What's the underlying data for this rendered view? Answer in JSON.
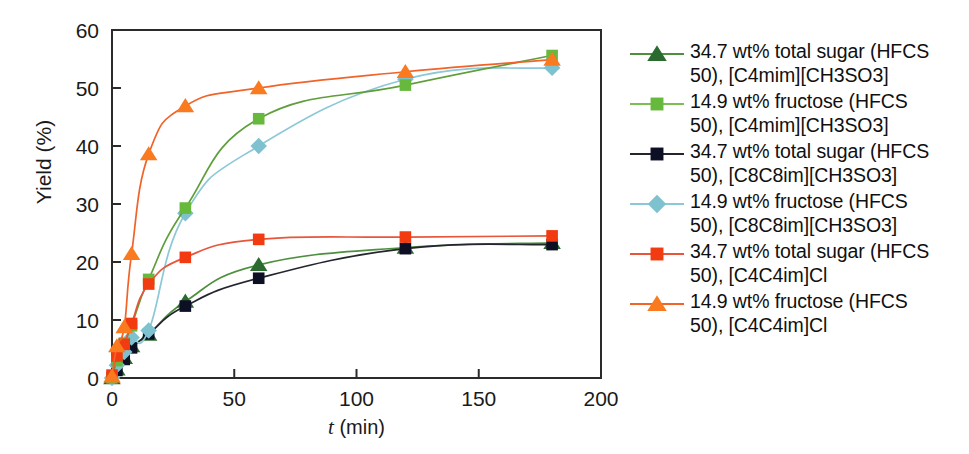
{
  "chart_data": {
    "type": "line",
    "title": "",
    "xlabel": "t (min)",
    "xlabel_italic": "t",
    "xlabel_rest": " (min)",
    "ylabel": "Yield (%)",
    "xlim": [
      0,
      200
    ],
    "ylim": [
      0,
      60
    ],
    "xticks": [
      0,
      50,
      100,
      150,
      200
    ],
    "yticks": [
      0,
      10,
      20,
      30,
      40,
      50,
      60
    ],
    "grid": false,
    "legend_position": "right",
    "x": [
      0,
      2,
      5,
      8,
      15,
      30,
      60,
      120,
      180
    ],
    "series": [
      {
        "name": "34.7 wt% total sugar (HFCS 50), [C4mim][CH3SO3]",
        "label_line1": "34.7 wt% total sugar (HFCS",
        "label_line2": "50), [C4mim][CH3SO3]",
        "marker": "triangle",
        "color": "#2c6b2f",
        "line_color": "#4e8f3f",
        "values": [
          0,
          1.5,
          3.5,
          5.5,
          7.5,
          13.2,
          19.5,
          22.5,
          23.3
        ]
      },
      {
        "name": "14.9  wt% fructose (HFCS 50), [C4mim][CH3SO3]",
        "label_line1": "14.9  wt% fructose (HFCS",
        "label_line2": "50), [C4mim][CH3SO3]",
        "marker": "square",
        "color": "#67b93e",
        "line_color": "#5f9e3b",
        "values": [
          0,
          3.0,
          6.0,
          9.0,
          17.0,
          29.3,
          44.7,
          50.5,
          55.6
        ]
      },
      {
        "name": "34.7 wt% total sugar (HFCS 50), [C8C8im][CH3SO3]",
        "label_line1": "34.7 wt% total sugar (HFCS",
        "label_line2": "50), [C8C8im][CH3SO3]",
        "marker": "square",
        "color": "#0d0f24",
        "line_color": "#24262f",
        "values": [
          0,
          1.3,
          3.2,
          5.2,
          7.6,
          12.4,
          17.2,
          22.3,
          23.0
        ]
      },
      {
        "name": "14.9  wt% fructose (HFCS 50), [C8C8im][CH3SO3]",
        "label_line1": "14.9  wt% fructose (HFCS",
        "label_line2": "50), [C8C8im][CH3SO3]",
        "marker": "diamond",
        "color": "#7ec2d0",
        "line_color": "#8cc8d6",
        "values": [
          0,
          2.2,
          4.5,
          7.0,
          8.2,
          28.4,
          40.0,
          51.5,
          53.5
        ]
      },
      {
        "name": "34.7 wt% total sugar (HFCS 50), [C4C4im]Cl",
        "label_line1": "34.7 wt% total sugar (HFCS",
        "label_line2": "50), [C4C4im]Cl",
        "marker": "square",
        "color": "#f23b11",
        "line_color": "#e8553a",
        "values": [
          0.5,
          3.8,
          5.8,
          9.4,
          16.2,
          20.8,
          23.9,
          24.3,
          24.5
        ]
      },
      {
        "name": "14.9  wt% fructose (HFCS 50), [C4C4im]Cl",
        "label_line1": "14.9  wt% fructose (HFCS",
        "label_line2": "50), [C4C4im]Cl",
        "marker": "triangle",
        "color": "#f97a1f",
        "line_color": "#f2632a",
        "values": [
          0.3,
          5.5,
          8.8,
          21.4,
          38.6,
          46.9,
          50.0,
          52.8,
          54.9
        ]
      }
    ]
  },
  "axes": {
    "ylabel": "Yield (%)",
    "xlabel_italic": "t",
    "xlabel_rest": " (min)",
    "xticklabels": [
      "0",
      "50",
      "100",
      "150",
      "200"
    ],
    "yticklabels": [
      "0",
      "10",
      "20",
      "30",
      "40",
      "50",
      "60"
    ]
  },
  "legend": {
    "items": [
      {
        "line1": "34.7 wt% total sugar (HFCS",
        "line2": "50), [C4mim][CH3SO3]",
        "marker": "triangle",
        "color": "#2c6b2f",
        "line_color": "#4e8f3f"
      },
      {
        "line1": "14.9  wt% fructose (HFCS",
        "line2": "50), [C4mim][CH3SO3]",
        "marker": "square",
        "color": "#67b93e",
        "line_color": "#7bbf54"
      },
      {
        "line1": "34.7 wt% total sugar (HFCS",
        "line2": "50), [C8C8im][CH3SO3]",
        "marker": "square",
        "color": "#0d0f24",
        "line_color": "#24262f"
      },
      {
        "line1": "14.9  wt% fructose (HFCS",
        "line2": "50), [C8C8im][CH3SO3]",
        "marker": "diamond",
        "color": "#7ec2d0",
        "line_color": "#8cc8d6"
      },
      {
        "line1": "34.7 wt% total sugar (HFCS",
        "line2": "50), [C4C4im]Cl",
        "marker": "square",
        "color": "#f23b11",
        "line_color": "#e8553a"
      },
      {
        "line1": "14.9  wt% fructose (HFCS",
        "line2": "50), [C4C4im]Cl",
        "marker": "triangle",
        "color": "#f97a1f",
        "line_color": "#f2632a"
      }
    ]
  }
}
